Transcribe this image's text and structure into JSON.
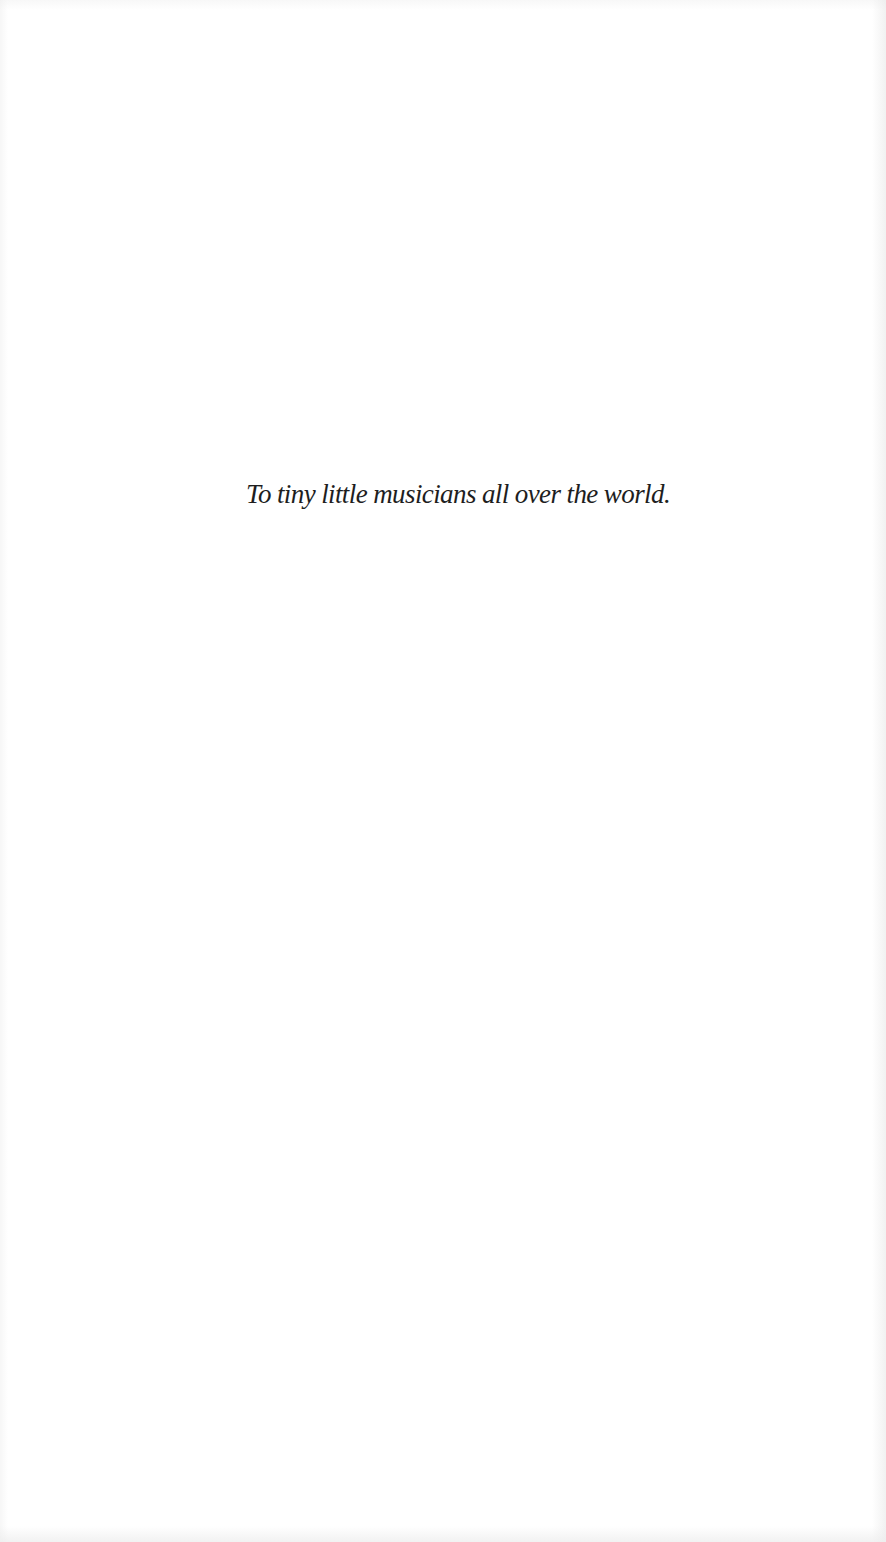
{
  "page": {
    "type": "dedication",
    "background_color": "#ffffff",
    "text_color": "#1e1e1e"
  },
  "dedication": {
    "text": "To tiny little musicians all over the world."
  }
}
